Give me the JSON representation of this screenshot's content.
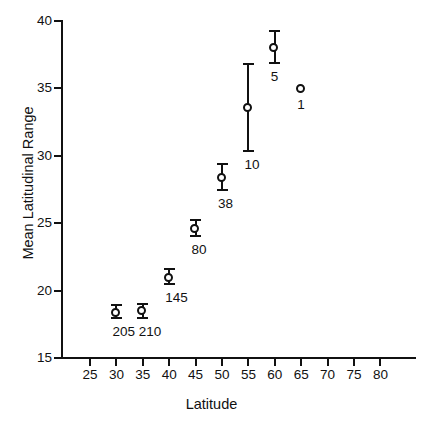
{
  "chart_data": {
    "type": "scatter",
    "title": "",
    "xlabel": "Latitude",
    "ylabel": "Mean Latitudinal Range",
    "xlim": [
      22.5,
      82.5
    ],
    "ylim": [
      15,
      40
    ],
    "xticks": [
      25,
      30,
      35,
      40,
      45,
      50,
      55,
      60,
      65,
      70,
      75,
      80
    ],
    "yticks": [
      15,
      20,
      25,
      30,
      35,
      40
    ],
    "xtick_labels": [
      "25",
      "30",
      "35",
      "40",
      "45",
      "50",
      "55",
      "60",
      "65",
      "70",
      "75",
      "80"
    ],
    "ytick_labels": [
      "15",
      "20",
      "25",
      "30",
      "35",
      "40"
    ],
    "grid": false,
    "legend": "none",
    "error_bars": "vertical",
    "marker": "open-circle",
    "point_annotation_meaning": "sample size (n) printed below and right of each point",
    "x": [
      30,
      35,
      40,
      45,
      50,
      55,
      60,
      65
    ],
    "y": [
      18.4,
      18.5,
      21.0,
      24.6,
      28.4,
      33.6,
      38.0,
      35.0
    ],
    "y_err_low": [
      17.9,
      17.9,
      20.4,
      24.0,
      27.4,
      30.3,
      36.8,
      null
    ],
    "y_err_high": [
      19.0,
      19.1,
      21.7,
      25.3,
      29.5,
      36.9,
      39.3,
      null
    ],
    "point_labels": [
      "205",
      "210",
      "145",
      "80",
      "38",
      "10",
      "5",
      "1"
    ],
    "points": [
      {
        "x": 30,
        "y": 18.4,
        "low": 17.9,
        "high": 19.0,
        "n": "205"
      },
      {
        "x": 35,
        "y": 18.5,
        "low": 17.9,
        "high": 19.1,
        "n": "210"
      },
      {
        "x": 40,
        "y": 21.0,
        "low": 20.4,
        "high": 21.7,
        "n": "145"
      },
      {
        "x": 45,
        "y": 24.6,
        "low": 24.0,
        "high": 25.3,
        "n": "80"
      },
      {
        "x": 50,
        "y": 28.4,
        "low": 27.4,
        "high": 29.5,
        "n": "38"
      },
      {
        "x": 55,
        "y": 33.6,
        "low": 30.3,
        "high": 36.9,
        "n": "10"
      },
      {
        "x": 60,
        "y": 38.0,
        "low": 36.8,
        "high": 39.3,
        "n": "5"
      },
      {
        "x": 65,
        "y": 35.0,
        "low": null,
        "high": null,
        "n": "1"
      }
    ],
    "colors": {
      "axis": "#111111",
      "marker_edge": "#111111",
      "marker_face": "#ffffff",
      "background": "#ffffff"
    }
  }
}
